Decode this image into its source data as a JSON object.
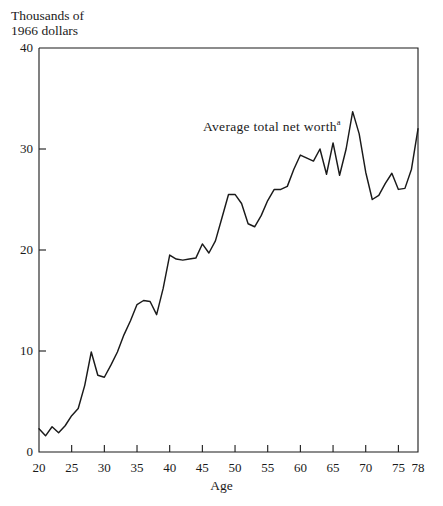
{
  "chart_data": {
    "type": "line",
    "title": "",
    "ylabel": "Thousands of\n1966 dollars",
    "xlabel": "Age",
    "xlim": [
      20,
      78
    ],
    "ylim": [
      0,
      40
    ],
    "grid": false,
    "legend_position": "inline-annotation",
    "annotations": [
      {
        "text": "Average total net worth",
        "superscript": "a",
        "x": 50,
        "y": 31.2
      }
    ],
    "yticks": [
      0,
      10,
      20,
      30,
      40
    ],
    "ytick_labels": [
      "0",
      "10",
      "20",
      "30",
      "40"
    ],
    "xticks": [
      20,
      25,
      30,
      35,
      40,
      45,
      50,
      55,
      60,
      65,
      70,
      75,
      78
    ],
    "xtick_labels": [
      "20",
      "25",
      "30",
      "35",
      "40",
      "45",
      "50",
      "55",
      "60",
      "65",
      "70",
      "75",
      "78"
    ],
    "series": [
      {
        "name": "Average total net worth",
        "x": [
          20,
          21,
          22,
          23,
          24,
          25,
          26,
          27,
          28,
          29,
          30,
          31,
          32,
          33,
          34,
          35,
          36,
          37,
          38,
          39,
          40,
          41,
          42,
          43,
          44,
          45,
          46,
          47,
          48,
          49,
          50,
          51,
          52,
          53,
          54,
          55,
          56,
          57,
          58,
          59,
          60,
          61,
          62,
          63,
          64,
          65,
          66,
          67,
          68,
          69,
          70,
          71,
          72,
          73,
          74,
          75,
          76,
          77,
          78
        ],
        "values": [
          2.3,
          1.6,
          2.5,
          1.9,
          2.6,
          3.6,
          4.3,
          6.6,
          9.9,
          7.6,
          7.4,
          8.6,
          9.9,
          11.6,
          13.0,
          14.6,
          15.0,
          14.9,
          13.6,
          16.2,
          19.5,
          19.1,
          19.0,
          19.1,
          19.2,
          20.6,
          19.7,
          20.9,
          23.2,
          25.5,
          25.5,
          24.6,
          22.6,
          22.3,
          23.4,
          24.9,
          26.0,
          26.0,
          26.3,
          28.0,
          29.4,
          29.1,
          28.8,
          30.0,
          27.5,
          30.6,
          27.4,
          30.0,
          33.7,
          31.5,
          27.7,
          25.0,
          25.4,
          26.6,
          27.6,
          26.0,
          26.1,
          28.0,
          32.0
        ]
      }
    ]
  },
  "footnote_marker": "a"
}
